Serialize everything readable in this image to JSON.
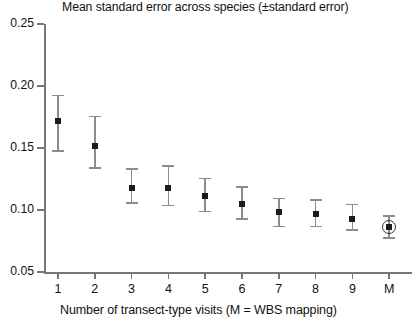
{
  "chart_data": {
    "type": "scatter",
    "title": "Mean standard error across species (±standard error)",
    "xlabel": "Number of transect-type visits (M = WBS mapping)",
    "ylabel": "",
    "categories": [
      "1",
      "2",
      "3",
      "4",
      "5",
      "6",
      "7",
      "8",
      "9",
      "M"
    ],
    "values": [
      0.172,
      0.152,
      0.118,
      0.118,
      0.111,
      0.105,
      0.098,
      0.097,
      0.093,
      0.086
    ],
    "err_low": [
      0.147,
      0.133,
      0.105,
      0.103,
      0.098,
      0.092,
      0.086,
      0.086,
      0.083,
      0.077
    ],
    "err_high": [
      0.193,
      0.176,
      0.134,
      0.136,
      0.126,
      0.119,
      0.11,
      0.109,
      0.105,
      0.096
    ],
    "highlight_index": 9,
    "highlight_style": "circled-marker",
    "ylim": [
      0.05,
      0.25
    ],
    "ytick_labels": [
      "0.25",
      "0.20",
      "0.15",
      "0.10",
      "0.05"
    ],
    "ytick_values": [
      0.25,
      0.2,
      0.15,
      0.1,
      0.05
    ],
    "grid": false,
    "legend": "none",
    "marker_color": "#1b1b1b",
    "errorbar_color": "#8c8c8c",
    "axis_color": "#777777"
  }
}
